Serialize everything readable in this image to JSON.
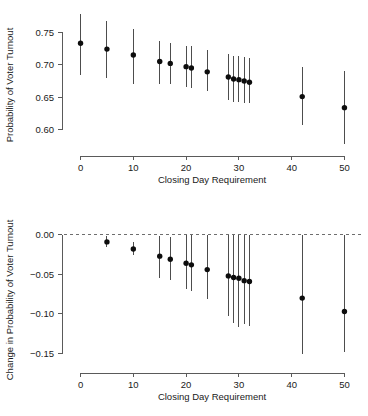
{
  "figure": {
    "background_color": "#ffffff",
    "point_color": "#0d0d0d",
    "bar_color": "#4d4d4d",
    "axis_color": "#5a5a5a",
    "reference_line_color": "#6e6e6e"
  },
  "chart_data": [
    {
      "type": "scatter",
      "panel": "top",
      "title": "",
      "xlabel": "Closing Day Requirement",
      "ylabel": "Probability of Voter Turnout",
      "xlim": [
        -2,
        52
      ],
      "ylim": [
        0.575,
        0.778
      ],
      "xticks": [
        0,
        10,
        20,
        30,
        40,
        50
      ],
      "xticklabels": [
        "0",
        "10",
        "20",
        "30",
        "40",
        "50"
      ],
      "yticks": [
        0.75,
        0.7,
        0.65,
        0.6
      ],
      "yticklabels": [
        "0.75",
        "0.70",
        "0.65",
        "0.60"
      ],
      "grid": false,
      "legend": "none",
      "error_bars": "vertical-95ci",
      "x": [
        0,
        5,
        10,
        15,
        17,
        20,
        21,
        24,
        28,
        29,
        30,
        31,
        32,
        42,
        50
      ],
      "values": [
        0.733,
        0.724,
        0.715,
        0.705,
        0.702,
        0.697,
        0.695,
        0.689,
        0.681,
        0.678,
        0.677,
        0.675,
        0.673,
        0.651,
        0.634
      ],
      "ci_low": [
        0.684,
        0.68,
        0.671,
        0.671,
        0.671,
        0.665,
        0.664,
        0.659,
        0.645,
        0.643,
        0.642,
        0.641,
        0.641,
        0.607,
        0.578
      ],
      "ci_high": [
        0.778,
        0.768,
        0.755,
        0.737,
        0.734,
        0.729,
        0.729,
        0.722,
        0.717,
        0.714,
        0.713,
        0.712,
        0.711,
        0.696,
        0.69
      ]
    },
    {
      "type": "scatter",
      "panel": "bottom",
      "title": "",
      "xlabel": "Closing Day Requirement",
      "ylabel": "Change in Probability of Voter Turnout",
      "xlim": [
        -2,
        52
      ],
      "ylim": [
        -0.162,
        0.006
      ],
      "xticks": [
        0,
        10,
        20,
        30,
        40,
        50
      ],
      "xticklabels": [
        "0",
        "10",
        "20",
        "30",
        "40",
        "50"
      ],
      "yticks": [
        0,
        -0.05,
        -0.1,
        -0.15
      ],
      "yticklabels": [
        "0.00",
        "−0.05",
        "−0.10",
        "−0.15"
      ],
      "grid": false,
      "legend": "none",
      "error_bars": "vertical-95ci",
      "reference_line": 0,
      "x": [
        5,
        10,
        15,
        17,
        20,
        21,
        24,
        28,
        29,
        30,
        31,
        32,
        42,
        50
      ],
      "values": [
        -0.009,
        -0.018,
        -0.027,
        -0.031,
        -0.036,
        -0.038,
        -0.044,
        -0.052,
        -0.054,
        -0.055,
        -0.058,
        -0.059,
        -0.08,
        -0.097
      ],
      "ci_low": [
        -0.015,
        -0.026,
        -0.054,
        -0.057,
        -0.069,
        -0.071,
        -0.081,
        -0.103,
        -0.112,
        -0.116,
        -0.113,
        -0.115,
        -0.15,
        -0.148
      ],
      "ci_high": [
        -0.002,
        -0.009,
        -0.002,
        -0.003,
        0.0,
        0.0,
        0.0,
        0.0,
        0.0,
        0.0,
        0.0,
        0.0,
        0.0,
        0.0
      ]
    }
  ]
}
